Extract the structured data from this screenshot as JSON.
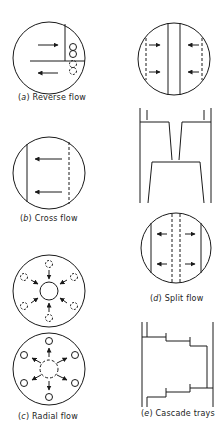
{
  "figure": {
    "panels": [
      {
        "id": "a",
        "letter": "a",
        "title": "Reverse flow"
      },
      {
        "id": "b",
        "letter": "b",
        "title": "Cross flow"
      },
      {
        "id": "c",
        "letter": "c",
        "title": "Radial flow"
      },
      {
        "id": "d",
        "letter": "d",
        "title": "Split flow"
      },
      {
        "id": "e",
        "letter": "e",
        "title": "Cascade trays"
      }
    ]
  },
  "colors": {
    "stroke": "#1a1a1a",
    "background": "#ffffff"
  }
}
